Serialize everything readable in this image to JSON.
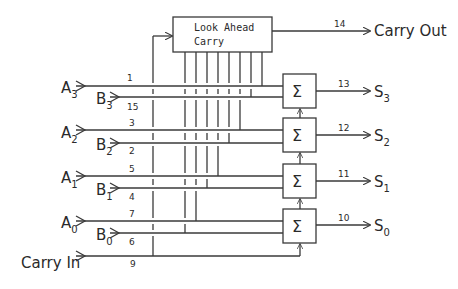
{
  "diagram": {
    "lookahead_box": {
      "line1": "Look Ahead",
      "line2": "Carry"
    },
    "carry_out": {
      "label": "Carry Out",
      "pin": "14"
    },
    "carry_in": {
      "label": "Carry In",
      "pin": "9"
    },
    "adder_symbol": "Σ",
    "inputs": [
      {
        "name": "A",
        "sub": "3",
        "pin": "1"
      },
      {
        "name": "B",
        "sub": "3",
        "pin": "15"
      },
      {
        "name": "A",
        "sub": "2",
        "pin": "3"
      },
      {
        "name": "B",
        "sub": "2",
        "pin": "2"
      },
      {
        "name": "A",
        "sub": "1",
        "pin": "5"
      },
      {
        "name": "B",
        "sub": "1",
        "pin": "4"
      },
      {
        "name": "A",
        "sub": "0",
        "pin": "7"
      },
      {
        "name": "B",
        "sub": "0",
        "pin": "6"
      }
    ],
    "outputs": [
      {
        "name": "S",
        "sub": "3",
        "pin": "13"
      },
      {
        "name": "S",
        "sub": "2",
        "pin": "12"
      },
      {
        "name": "S",
        "sub": "1",
        "pin": "11"
      },
      {
        "name": "S",
        "sub": "0",
        "pin": "10"
      }
    ]
  }
}
